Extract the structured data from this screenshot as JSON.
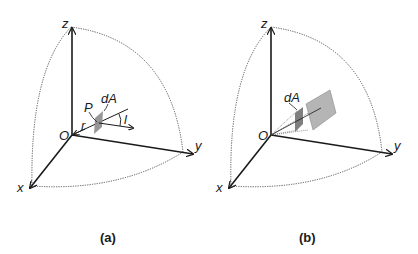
{
  "figure": {
    "panels": [
      {
        "id": "a",
        "caption": "(a)",
        "axes": {
          "x": "x",
          "y": "y",
          "z": "z",
          "origin": "O"
        },
        "labels": {
          "point": "P",
          "area": "dA",
          "radius": "r",
          "direction": "l"
        }
      },
      {
        "id": "b",
        "caption": "(b)",
        "axes": {
          "x": "x",
          "y": "y",
          "z": "z",
          "origin": "O"
        },
        "labels": {
          "area": "dA"
        }
      }
    ],
    "colors": {
      "axis": "#1a1a1a",
      "arc": "#555555",
      "patch_fill": "#8c8c8c",
      "projection_fill": "#b5b5b5",
      "background": "#ffffff"
    }
  }
}
